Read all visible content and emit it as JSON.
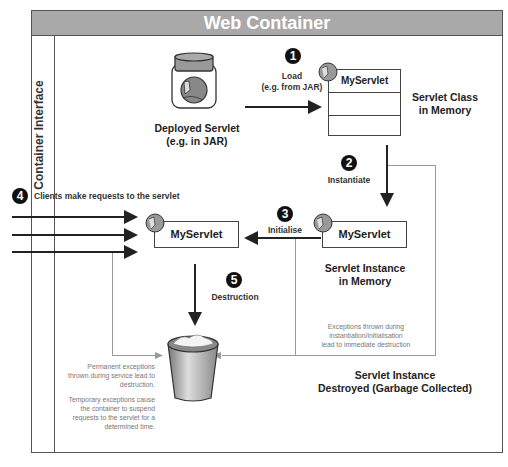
{
  "header": {
    "title": "Web Container"
  },
  "sidebar": {
    "label": "Container Interface"
  },
  "nodes": {
    "deployed_servlet": {
      "line1": "Deployed Servlet",
      "line2": "(e.g. in JAR)"
    },
    "servlet_class": {
      "box_title": "MyServlet",
      "caption_line1": "Servlet Class",
      "caption_line2": "in Memory"
    },
    "servlet_instance": {
      "box_title": "MyServlet",
      "caption_line1": "Servlet Instance",
      "caption_line2": "in Memory"
    },
    "active_servlet": {
      "box_title": "MyServlet"
    },
    "destroyed": {
      "line1": "Servlet Instance",
      "line2": "Destroyed (Garbage Collected)"
    }
  },
  "steps": [
    {
      "number": "1",
      "label_line1": "Load",
      "label_line2": "(e.g. from JAR)"
    },
    {
      "number": "2",
      "label_line1": "Instantiate"
    },
    {
      "number": "3",
      "label_line1": "Initialise"
    },
    {
      "number": "4",
      "label_line1": "Clients make requests to the servlet"
    },
    {
      "number": "5",
      "label_line1": "Destruction"
    }
  ],
  "notes": {
    "instantiation_exceptions": [
      "Exceptions thrown during",
      "instantiation/initialisation",
      "lead to immediate destruction"
    ],
    "service_exceptions_p1": [
      "Permanent exceptions",
      "thrown during service lead to",
      "destruction."
    ],
    "service_exceptions_p2": [
      "Temporary exceptions cause",
      "the container to suspend",
      "requests to the servlet for a",
      "determined time."
    ]
  },
  "colors": {
    "header_bg": "#a9a9a9",
    "border": "#555555",
    "grey_line": "#999999",
    "note_text": "#777777"
  }
}
